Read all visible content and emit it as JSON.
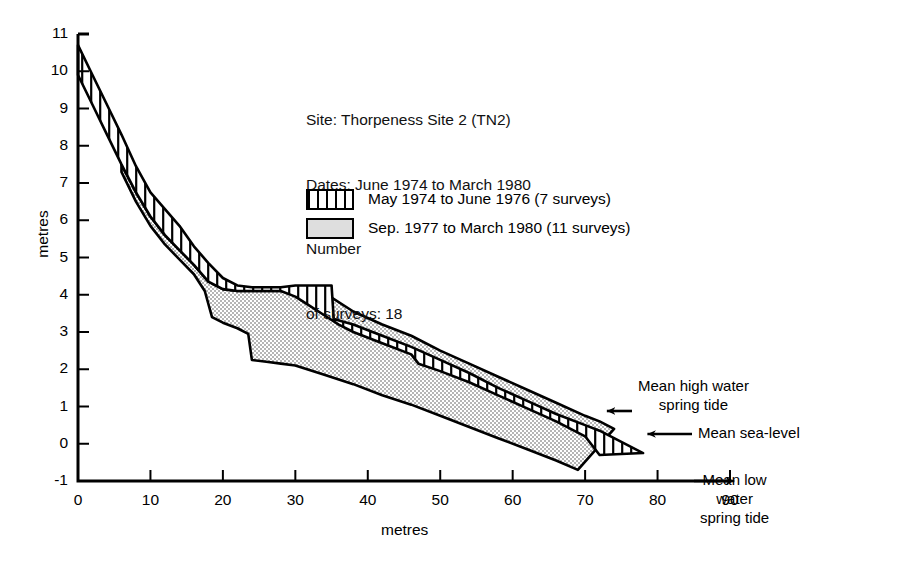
{
  "chart_data": {
    "type": "area",
    "title": "",
    "xlabel": "metres",
    "ylabel": "metres",
    "xlim": [
      0,
      90
    ],
    "ylim": [
      -1,
      11
    ],
    "xticks": [
      0,
      10,
      20,
      30,
      40,
      50,
      60,
      70,
      80,
      90
    ],
    "yticks": [
      -1,
      0,
      1,
      2,
      3,
      4,
      5,
      6,
      7,
      8,
      9,
      10,
      11
    ],
    "grid": false,
    "legend_position": "upper-right",
    "series": [
      {
        "name": "May 1974 to June 1976 (7 surveys)",
        "fill": "vertical-hatch",
        "upper": [
          [
            0,
            10.7
          ],
          [
            2,
            9.9
          ],
          [
            4,
            9.1
          ],
          [
            6,
            8.3
          ],
          [
            8,
            7.45
          ],
          [
            10,
            6.75
          ],
          [
            12,
            6.3
          ],
          [
            14,
            5.85
          ],
          [
            16,
            5.3
          ],
          [
            18,
            4.85
          ],
          [
            20,
            4.45
          ],
          [
            22,
            4.25
          ],
          [
            24,
            4.2
          ],
          [
            26,
            4.2
          ],
          [
            28,
            4.2
          ],
          [
            30,
            4.25
          ],
          [
            32,
            4.25
          ],
          [
            34,
            4.25
          ],
          [
            35,
            4.25
          ],
          [
            35.3,
            3.35
          ],
          [
            38,
            3.2
          ],
          [
            42,
            2.9
          ],
          [
            46,
            2.6
          ],
          [
            50,
            2.25
          ],
          [
            54,
            1.9
          ],
          [
            58,
            1.5
          ],
          [
            62,
            1.15
          ],
          [
            66,
            0.8
          ],
          [
            70,
            0.5
          ],
          [
            72,
            0.35
          ],
          [
            78,
            -0.25
          ]
        ],
        "lower": [
          [
            0,
            9.9
          ],
          [
            2,
            9.1
          ],
          [
            4,
            8.3
          ],
          [
            6,
            7.5
          ],
          [
            8,
            6.75
          ],
          [
            10,
            6.1
          ],
          [
            12,
            5.6
          ],
          [
            14,
            5.2
          ],
          [
            16,
            4.8
          ],
          [
            18,
            4.35
          ],
          [
            20,
            4.15
          ],
          [
            22,
            4.1
          ],
          [
            24,
            4.1
          ],
          [
            26,
            4.1
          ],
          [
            28,
            4.1
          ],
          [
            30,
            3.95
          ],
          [
            32,
            3.7
          ],
          [
            34,
            3.45
          ],
          [
            36,
            3.2
          ],
          [
            38,
            3.0
          ],
          [
            42,
            2.7
          ],
          [
            46,
            2.4
          ],
          [
            47,
            2.15
          ],
          [
            50,
            1.95
          ],
          [
            54,
            1.65
          ],
          [
            58,
            1.3
          ],
          [
            62,
            0.95
          ],
          [
            66,
            0.6
          ],
          [
            70,
            0.2
          ],
          [
            72,
            -0.3
          ]
        ]
      },
      {
        "name": "Sep. 1977 to March 1980 (11 surveys)",
        "fill": "grey-stipple",
        "upper": [
          [
            6,
            7.5
          ],
          [
            8,
            6.75
          ],
          [
            10,
            6.1
          ],
          [
            12,
            5.6
          ],
          [
            14,
            5.2
          ],
          [
            16,
            4.8
          ],
          [
            18,
            4.35
          ],
          [
            20,
            4.15
          ],
          [
            22,
            4.1
          ],
          [
            26,
            4.1
          ],
          [
            28,
            4.1
          ],
          [
            30,
            4.1
          ],
          [
            34,
            4.05
          ],
          [
            38,
            3.55
          ],
          [
            42,
            3.2
          ],
          [
            46,
            2.9
          ],
          [
            50,
            2.5
          ],
          [
            54,
            2.15
          ],
          [
            58,
            1.8
          ],
          [
            62,
            1.45
          ],
          [
            66,
            1.1
          ],
          [
            70,
            0.75
          ],
          [
            72,
            0.6
          ],
          [
            74,
            0.4
          ]
        ],
        "lower": [
          [
            6,
            7.3
          ],
          [
            8,
            6.5
          ],
          [
            10,
            5.85
          ],
          [
            12,
            5.35
          ],
          [
            14,
            4.95
          ],
          [
            16,
            4.55
          ],
          [
            17.5,
            4.1
          ],
          [
            18.5,
            3.4
          ],
          [
            20,
            3.25
          ],
          [
            22,
            3.1
          ],
          [
            23.5,
            2.95
          ],
          [
            24,
            2.25
          ],
          [
            26,
            2.2
          ],
          [
            28,
            2.15
          ],
          [
            30,
            2.1
          ],
          [
            34,
            1.85
          ],
          [
            38,
            1.6
          ],
          [
            42,
            1.3
          ],
          [
            46,
            1.05
          ],
          [
            50,
            0.75
          ],
          [
            54,
            0.45
          ],
          [
            58,
            0.15
          ],
          [
            62,
            -0.15
          ],
          [
            66,
            -0.45
          ],
          [
            69,
            -0.7
          ]
        ]
      }
    ],
    "annotations": [
      {
        "name": "mean-high-water-spring-tide",
        "text": "Mean high water\nspring tide",
        "arrow_to_x": 73.5,
        "arrow_to_y": 1.05
      },
      {
        "name": "mean-sea-level",
        "text": "Mean sea-level",
        "arrow_to_x": 79,
        "arrow_to_y": 0.0
      },
      {
        "name": "mean-low-water-spring-tide",
        "text": "Mean low\nwater\nspring tide",
        "arrow_to_x": 90,
        "arrow_to_y": -1.0
      }
    ]
  },
  "info": {
    "site": "Site: Thorpeness Site 2 (TN2)",
    "dates": "Dates: June 1974 to March 1980",
    "number": "Number",
    "surveys": "of surveys: 18"
  },
  "legend": {
    "entries": [
      {
        "label": "May 1974 to June 1976 (7 surveys)",
        "pattern": "vertical-hatch"
      },
      {
        "label": "Sep. 1977 to March 1980 (11 surveys)",
        "pattern": "grey-stipple"
      }
    ]
  },
  "annotations": {
    "mhw_line1": "Mean high water",
    "mhw_line2": "spring tide",
    "msl": "Mean sea-level",
    "mlw_line1": "Mean low",
    "mlw_line2": "water",
    "mlw_line3": "spring tide"
  },
  "axes": {
    "x_title": "metres",
    "y_title": "metres"
  },
  "colors": {
    "line": "#000000",
    "grey_fill": "#d9d9d9",
    "background": "#ffffff"
  }
}
